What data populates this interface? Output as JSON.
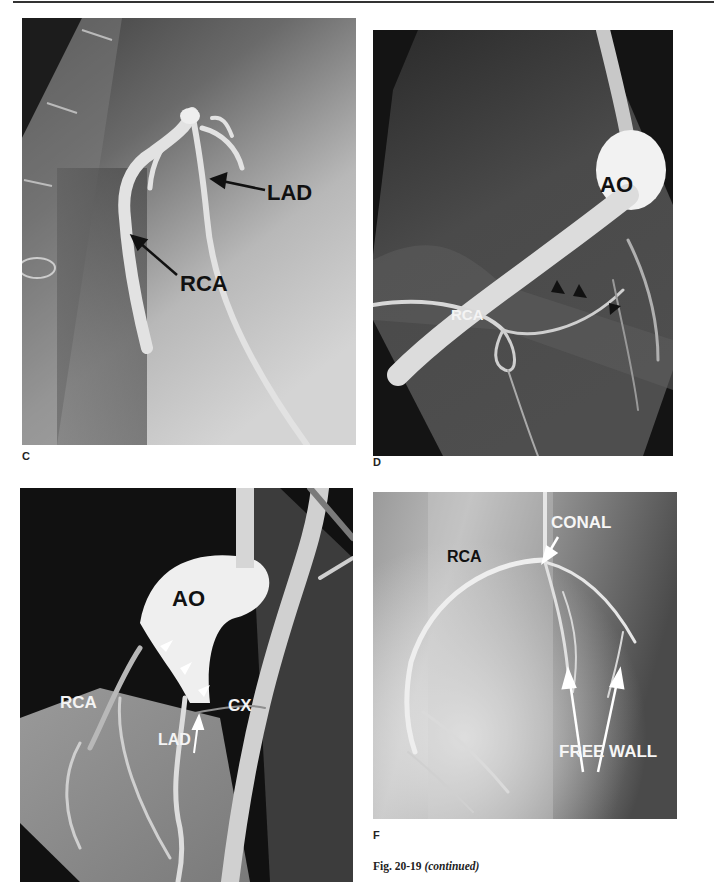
{
  "figure": {
    "caption_prefix": "Fig. 20-19",
    "caption_suffix": "(continued)",
    "panels": {
      "C": {
        "letter": "C",
        "labels": {
          "lad": "LAD",
          "rca": "RCA"
        },
        "label_color": "#111111"
      },
      "D": {
        "letter": "D",
        "labels": {
          "ao": "AO",
          "rca": "RCA"
        },
        "arrowheads": 3,
        "arrowhead_color": "#111111"
      },
      "E": {
        "letter": "",
        "labels": {
          "ao": "AO",
          "rca": "RCA",
          "cx": "CX",
          "lad": "LAD"
        },
        "arrowheads": 3,
        "arrowhead_color": "#ffffff"
      },
      "F": {
        "letter": "F",
        "labels": {
          "conal": "CONAL",
          "rca": "RCA",
          "free_wall": "FREE WALL"
        },
        "arrows": 3,
        "arrow_color": "#ffffff"
      }
    }
  }
}
